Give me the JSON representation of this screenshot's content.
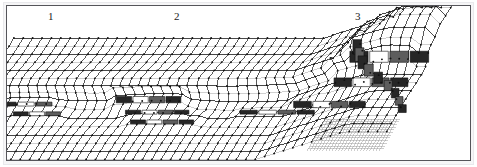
{
  "figure": {
    "kind": "3d-wireframe-surface-mesh",
    "background_color": "#ffffff",
    "frame_color": "#55555a",
    "mesh_line_color": "#1a1a1a",
    "mesh_faint_color": "#8d8d8d",
    "vertex_dot_color": "#111111",
    "riser_dark_fill": "#262626",
    "riser_mid_fill": "#5d5d5d",
    "riser_light_fill": "#ffffff",
    "projection": "oblique-isometric",
    "has_frame": true,
    "has_vertex_dots": true
  },
  "annotations": [
    {
      "id": "label-1",
      "text": "1",
      "x": 48,
      "y": 11
    },
    {
      "id": "label-2",
      "text": "2",
      "x": 174,
      "y": 11
    },
    {
      "id": "label-3",
      "text": "3",
      "x": 355,
      "y": 11
    }
  ],
  "chart_data": {
    "type": "surface",
    "title": "",
    "subtitle": "",
    "xlabel": "",
    "ylabel": "",
    "zlabel": "",
    "grid": true,
    "legend_position": "none",
    "projection": {
      "origin_x": 14,
      "origin_y": 38,
      "u_dx": 9.4,
      "u_dy": 0.0,
      "v_dx": -4.6,
      "v_dy": 8.1,
      "z_scale": -7.0
    },
    "axis_ranges": {
      "u": [
        0,
        46
      ],
      "v": [
        0,
        14
      ],
      "z": [
        0,
        4
      ]
    },
    "annotations": [
      "1",
      "2",
      "3"
    ],
    "features": [
      {
        "name": "feature-1",
        "label": "1",
        "u_center": 6.0,
        "v_center": 7.0,
        "terrace_levels": 2,
        "riser_count": 4,
        "bunching_strength": 0.55
      },
      {
        "name": "feature-2",
        "label": "2",
        "u_center": 19.0,
        "v_center": 7.0,
        "terrace_levels": 3,
        "riser_count": 7,
        "bunching_strength": 0.75
      },
      {
        "name": "feature-3",
        "label": "3",
        "u_center": 36.0,
        "v_center": 6.0,
        "terrace_levels": 4,
        "riser_count": 9,
        "bunching_strength": 0.9
      }
    ],
    "terraces": [
      {
        "id": "t1a",
        "u0": 2.0,
        "u1": 7.5,
        "v": 8.4,
        "level": 1
      },
      {
        "id": "t1b",
        "u0": 4.0,
        "u1": 9.0,
        "v": 9.6,
        "level": 1
      },
      {
        "id": "t2a",
        "u0": 14.0,
        "u1": 21.0,
        "v": 8.0,
        "level": 2
      },
      {
        "id": "t2b",
        "u0": 15.5,
        "u1": 22.5,
        "v": 9.4,
        "level": 1
      },
      {
        "id": "t2c",
        "u0": 17.0,
        "u1": 24.0,
        "v": 10.6,
        "level": 1
      },
      {
        "id": "t3a",
        "u0": 28.0,
        "u1": 36.0,
        "v": 9.4,
        "level": 1
      },
      {
        "id": "t3b",
        "u0": 33.0,
        "u1": 41.0,
        "v": 8.6,
        "level": 2
      },
      {
        "id": "t3c",
        "u0": 37.0,
        "u1": 45.0,
        "v": 6.0,
        "level": 3
      },
      {
        "id": "t3d",
        "u0": 38.0,
        "u1": 46.0,
        "v": 3.0,
        "level": 4
      }
    ],
    "series": [
      {
        "name": "mesh-rows",
        "count": 15,
        "orientation": "u-direction"
      },
      {
        "name": "mesh-columns",
        "count": 47,
        "orientation": "v-direction"
      }
    ],
    "subgrid": {
      "name": "fine-subgrid-lower-right",
      "u0": 38.0,
      "u1": 46.0,
      "v0": 10.0,
      "v1": 14.0,
      "divisions": 2
    }
  }
}
